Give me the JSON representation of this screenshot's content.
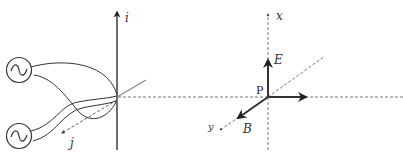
{
  "figure": {
    "left_panel": {
      "axis_labels": {
        "vertical": "i",
        "diagonal": "j"
      },
      "sources": [
        {
          "name": "ac-source-top",
          "symbol": "~"
        },
        {
          "name": "ac-source-bottom",
          "symbol": "~"
        }
      ]
    },
    "right_panel": {
      "axis_labels": {
        "vertical": "x",
        "diagonal": "y"
      },
      "point_label": "P",
      "vectors": [
        {
          "name": "E",
          "label": "E",
          "direction": "up (+x)"
        },
        {
          "name": "B",
          "label": "B",
          "direction": "toward viewer (+y)"
        },
        {
          "name": "propagation",
          "label": "",
          "direction": "right"
        }
      ]
    },
    "colors": {
      "line": "#222222",
      "dashed": "#555555",
      "grey_line": "#888888"
    }
  }
}
